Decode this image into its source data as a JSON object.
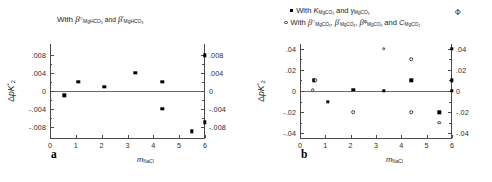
{
  "figure": {
    "panels": [
      {
        "key": "a",
        "letter": "a",
        "title_plain": "With β°MgHCO3 and β'MgHCO3",
        "title_parts": {
          "with": "With",
          "beta": "β",
          "sup1": "○",
          "sub1": "MgHCO",
          "sub1_num": "3",
          "and": "and",
          "sup2": "'",
          "sub2": "MgHCO",
          "sub2_num": "3"
        },
        "ylabel_parts": {
          "delta": "Δ",
          "pk": "pK",
          "sup": "*",
          "sub": "2"
        },
        "xlabel_parts": {
          "m": "m",
          "sub": "NaCl"
        },
        "axes": {
          "xlim": [
            0,
            6
          ],
          "ylim": [
            -0.0105,
            0.0105
          ],
          "xticks": [
            0,
            1,
            2,
            3,
            4,
            5,
            6
          ],
          "xticklabels": [
            "0",
            "1",
            "2",
            "3",
            "4",
            "5",
            "6"
          ],
          "yticks": [
            -0.008,
            -0.004,
            0,
            0.004,
            0.008
          ],
          "yticklabels": [
            "-.008",
            "-.004",
            "0",
            ".004",
            ".008"
          ],
          "right_yticklabels": [
            "-.008",
            "-.004",
            "0",
            ".004",
            ".008"
          ]
        }
      },
      {
        "key": "b",
        "letter": "b",
        "legend": [
          {
            "marker": "filled",
            "with": "With",
            "k": "K",
            "ksub": "MgCO",
            "ksub_num": "3",
            "and": "and",
            "gamma": "γ",
            "gsub": "MgCO",
            "gsub_num": "3"
          },
          {
            "marker": "open",
            "with": "With",
            "b1": "β",
            "b1sup": "○",
            "b1sub": "MgCO",
            "b1num": "3",
            "b2": "β",
            "b2sup": "'",
            "b2sub": "MgCO",
            "b2num": "3",
            "b3": "β",
            "b3sup": "φ",
            "b3sub": "MgCO",
            "b3num": "3",
            "and": "and",
            "c": "C",
            "csup": "Φ",
            "csub": "MgCO",
            "cnum": "3"
          }
        ],
        "ylabel_parts": {
          "delta": "Δ",
          "pk": "pK",
          "sup": "*",
          "sub": "2"
        },
        "xlabel_parts": {
          "m": "m",
          "sub": "NaCl"
        },
        "axes": {
          "xlim": [
            0,
            6
          ],
          "ylim": [
            -0.0445,
            0.0445
          ],
          "xticks": [
            0,
            1,
            2,
            3,
            4,
            5,
            6
          ],
          "xticklabels": [
            "0",
            "1",
            "2",
            "3",
            "4",
            "5",
            "6"
          ],
          "yticks": [
            -0.04,
            -0.02,
            0,
            0.02,
            0.04
          ],
          "yticklabels": [
            "-.04",
            "-.02",
            "0",
            ".02",
            ".04"
          ],
          "right_yticklabels": [
            "-.04",
            "-.02",
            "0",
            ".02",
            ".04"
          ]
        }
      }
    ]
  },
  "chart_data": [
    {
      "type": "scatter",
      "panel": "a",
      "title": "With β°(MgHCO3) and β'(MgHCO3)",
      "xlabel": "m NaCl",
      "ylabel": "ΔpK*2",
      "xlim": [
        0,
        6
      ],
      "ylim": [
        -0.0105,
        0.0105
      ],
      "grid": false,
      "zero_reference_line": 0,
      "series": [
        {
          "name": "ΔpK*2 residuals",
          "marker": "filled-square",
          "points": [
            {
              "x": 0.55,
              "y": -0.001
            },
            {
              "x": 1.1,
              "y": 0.002
            },
            {
              "x": 2.1,
              "y": 0.001
            },
            {
              "x": 3.3,
              "y": 0.004
            },
            {
              "x": 4.35,
              "y": 0.002
            },
            {
              "x": 4.35,
              "y": -0.004
            },
            {
              "x": 5.5,
              "y": -0.009
            },
            {
              "x": 6.0,
              "y": 0.008
            },
            {
              "x": 6.0,
              "y": -0.007
            }
          ]
        }
      ]
    },
    {
      "type": "scatter",
      "panel": "b",
      "title": "",
      "xlabel": "m NaCl",
      "ylabel": "ΔpK*2",
      "xlim": [
        0,
        6
      ],
      "ylim": [
        -0.0445,
        0.0445
      ],
      "grid": false,
      "zero_reference_line": 0,
      "legend_position": "above-plot",
      "series": [
        {
          "name": "With K(MgCO3) and γ(MgCO3)",
          "marker": "filled-square",
          "points": [
            {
              "x": 0.55,
              "y": 0.01
            },
            {
              "x": 1.1,
              "y": -0.01
            },
            {
              "x": 2.1,
              "y": 0.001
            },
            {
              "x": 3.3,
              "y": 0.0
            },
            {
              "x": 4.4,
              "y": 0.01
            },
            {
              "x": 5.5,
              "y": -0.02
            },
            {
              "x": 6.0,
              "y": 0.04
            },
            {
              "x": 6.0,
              "y": 0.01
            },
            {
              "x": 6.0,
              "y": 0.0
            }
          ]
        },
        {
          "name": "With β°, β', βφ and CΦ (MgCO3)",
          "marker": "open-circle",
          "points": [
            {
              "x": 0.5,
              "y": 0.001
            },
            {
              "x": 0.62,
              "y": 0.01
            },
            {
              "x": 2.1,
              "y": -0.02
            },
            {
              "x": 3.3,
              "y": 0.04
            },
            {
              "x": 4.4,
              "y": 0.03
            },
            {
              "x": 4.4,
              "y": -0.02
            },
            {
              "x": 5.5,
              "y": -0.03
            }
          ]
        }
      ]
    }
  ]
}
